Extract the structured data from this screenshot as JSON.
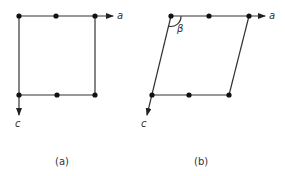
{
  "diagram": {
    "type": "lattice-unit-cell",
    "panels": [
      {
        "caption": "(a)",
        "axis_a_label": "a",
        "axis_c_label": "c",
        "shape": "rectangle",
        "points_per_edge": 3
      },
      {
        "caption": "(b)",
        "axis_a_label": "a",
        "axis_c_label": "c",
        "angle_label": "β",
        "shape": "parallelogram",
        "points_per_edge": 3
      }
    ]
  }
}
